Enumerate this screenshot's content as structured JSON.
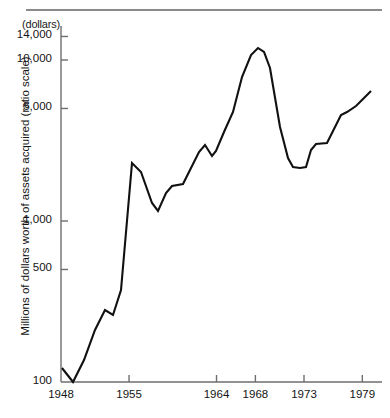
{
  "figure": {
    "unit_note": "(dollars)",
    "y_axis_title": "Millions of dollars worth of assets acquired (ratio scale)"
  },
  "chart_data": {
    "type": "line",
    "title": "",
    "subtitle": "",
    "xlabel": "",
    "ylabel": "Millions of dollars worth of assets acquired (ratio scale)",
    "unit_note": "(dollars)",
    "yscale": "log",
    "ylim": [
      100,
      17000
    ],
    "xlim": [
      1948,
      1980
    ],
    "grid": false,
    "legend": null,
    "y_ticks": [
      100,
      500,
      1000,
      5000,
      10000,
      14000
    ],
    "y_tick_labels": [
      "100",
      "500",
      "1,000",
      "5,000",
      "10,000",
      "14,000"
    ],
    "x_ticks": [
      1948,
      1955,
      1964,
      1968,
      1973,
      1979
    ],
    "x_tick_labels": [
      "1948",
      "1955",
      "1964",
      "1968",
      "1973",
      "1979"
    ],
    "series": [
      {
        "name": "Assets acquired",
        "color": "#111111",
        "x": [
          1948,
          1949,
          1950,
          1951,
          1952,
          1953,
          1954,
          1955,
          1956,
          1957,
          1958,
          1959,
          1960,
          1961,
          1962,
          1963,
          1964,
          1965,
          1966,
          1967,
          1968,
          1969,
          1970,
          1971,
          1972,
          1973,
          1974,
          1975,
          1976,
          1977,
          1978,
          1979
        ],
        "y": [
          146,
          102,
          180,
          380,
          560,
          530,
          900,
          2650,
          2500,
          1500,
          1250,
          1400,
          1800,
          1900,
          2050,
          2500,
          2400,
          3100,
          4200,
          8000,
          13800,
          12200,
          3900,
          2500,
          2400,
          2400,
          3000,
          3150,
          4500,
          4700,
          5500,
          6800
        ]
      }
    ]
  },
  "plot_geometry": {
    "axis_x_left": 61,
    "axis_y_bottom": 382,
    "axis_y_top": 26,
    "axis_x_right": 382,
    "polyline_points": "62,368 73,382 84,360 95,330 105,310 113,315 121,290 132,163 141,172 152,203 158,211 166,193 172,186 183,184 190,170 199,152 205,145 212,156 216,151 224,132 233,112 242,77 251,55 258,48 264,52 270,68 280,127 288,158 293,167 300,168 306,167 311,150 316,144 327,143 334,129 341,115 347,112 356,106 364,98 371,91"
  }
}
